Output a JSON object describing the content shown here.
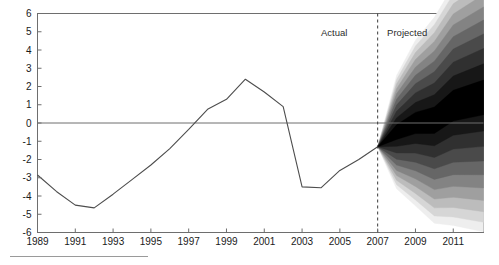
{
  "chart_data": {
    "type": "area",
    "title": "",
    "subtitle": "",
    "xlabel": "",
    "ylabel": "",
    "xlim": [
      1989,
      2012.6
    ],
    "ylim": [
      -6,
      6
    ],
    "grid": false,
    "legend_position": "none",
    "x_tick_labels": [
      "1989",
      "1991",
      "1993",
      "1995",
      "1997",
      "1999",
      "2001",
      "2003",
      "2005",
      "2007",
      "2009",
      "2011"
    ],
    "x_tick_values": [
      1989,
      1991,
      1993,
      1995,
      1997,
      1999,
      2001,
      2003,
      2005,
      2007,
      2009,
      2011
    ],
    "y_tick_labels": [
      "6",
      "5",
      "4",
      "3",
      "2",
      "1",
      "0",
      "-1",
      "-2",
      "-3",
      "-4",
      "-5",
      "-6"
    ],
    "y_tick_values": [
      6,
      5,
      4,
      3,
      2,
      1,
      0,
      -1,
      -2,
      -3,
      -4,
      -5,
      -6
    ],
    "zero_line": 0,
    "divider_year": 2007,
    "annotations": [
      {
        "text": "Actual",
        "x": 2005.4,
        "y": 4.75,
        "anchor": "end"
      },
      {
        "text": "Projected",
        "x": 2007.5,
        "y": 4.75,
        "anchor": "start"
      }
    ],
    "series": [
      {
        "name": "Actual",
        "type": "line",
        "color": "#4d4d4d",
        "x": [
          1989,
          1990,
          1991,
          1992,
          1993,
          1994,
          1995,
          1996,
          1997,
          1998,
          1999,
          2000,
          2001,
          2002,
          2003,
          2004,
          2005,
          2006,
          2007
        ],
        "values": [
          -2.85,
          -3.75,
          -4.5,
          -4.65,
          -3.9,
          -3.1,
          -2.3,
          -1.4,
          -0.35,
          0.75,
          1.3,
          2.4,
          1.7,
          0.9,
          -3.5,
          -3.55,
          -2.6,
          -2.0,
          -1.3
        ]
      },
      {
        "name": "Projected central",
        "type": "fan-center",
        "x": [
          2007,
          2008,
          2009,
          2010,
          2011,
          2012.6
        ],
        "values": [
          -1.3,
          -0.5,
          0.0,
          0.15,
          0.95,
          1.4
        ]
      }
    ],
    "fan_bands": [
      {
        "level": 1,
        "shade": "#000000",
        "half_width": [
          0.0,
          0.4,
          0.58,
          0.72,
          0.84,
          0.95
        ]
      },
      {
        "level": 2,
        "shade": "#171717",
        "half_width": [
          0.0,
          0.78,
          1.12,
          1.4,
          1.62,
          1.84
        ]
      },
      {
        "level": 3,
        "shade": "#303030",
        "half_width": [
          0.0,
          1.14,
          1.65,
          2.04,
          2.38,
          2.68
        ]
      },
      {
        "level": 4,
        "shade": "#4a4a4a",
        "half_width": [
          0.0,
          1.48,
          2.15,
          2.66,
          3.1,
          3.48
        ]
      },
      {
        "level": 5,
        "shade": "#666666",
        "half_width": [
          0.0,
          1.8,
          2.62,
          3.24,
          3.78,
          4.24
        ]
      },
      {
        "level": 6,
        "shade": "#838383",
        "half_width": [
          0.0,
          2.1,
          3.06,
          3.8,
          4.42,
          4.96
        ]
      },
      {
        "level": 7,
        "shade": "#9f9f9f",
        "half_width": [
          0.0,
          2.38,
          3.48,
          4.32,
          5.02,
          5.64
        ]
      },
      {
        "level": 8,
        "shade": "#bcbcbc",
        "half_width": [
          0.0,
          2.64,
          3.86,
          4.8,
          5.58,
          6.26
        ]
      },
      {
        "level": 9,
        "shade": "#d6d6d6",
        "half_width": [
          0.0,
          2.88,
          4.22,
          5.24,
          6.1,
          6.84
        ]
      },
      {
        "level": 10,
        "shade": "#eeeeee",
        "half_width": [
          0.0,
          3.1,
          4.54,
          5.64,
          6.56,
          7.36
        ]
      }
    ],
    "fan_x": [
      2007,
      2008,
      2009,
      2010,
      2011,
      2012.6
    ]
  },
  "footer": {
    "rule_present": true
  }
}
